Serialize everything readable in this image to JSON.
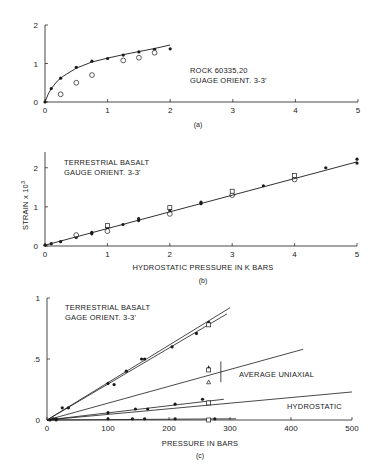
{
  "chart_data": [
    {
      "id": "a",
      "type": "scatter",
      "caption": "(a)",
      "title": "",
      "annotation": [
        "ROCK 60335,20",
        "GUAGE ORIENT. 3-3'"
      ],
      "xlabel": "",
      "ylabel": "",
      "xlim": [
        0,
        5
      ],
      "ylim": [
        0,
        2
      ],
      "x_ticks": [
        "0",
        "1",
        "2",
        "3",
        "4",
        "5"
      ],
      "y_ticks": [
        "0",
        "1",
        "2"
      ],
      "grid": false,
      "series": [
        {
          "name": "filled",
          "marker": "filled-circle",
          "x": [
            0,
            0.1,
            0.25,
            0.5,
            0.75,
            1.0,
            1.25,
            1.5,
            1.75,
            2.0
          ],
          "y": [
            0,
            0.35,
            0.62,
            0.9,
            1.06,
            1.13,
            1.22,
            1.3,
            1.37,
            1.38
          ]
        },
        {
          "name": "open",
          "marker": "open-circle",
          "x": [
            0.25,
            0.5,
            0.75,
            1.25,
            1.5,
            1.75
          ],
          "y": [
            0.2,
            0.5,
            0.7,
            1.08,
            1.15,
            1.28
          ]
        },
        {
          "name": "fit",
          "marker": "line",
          "x": [
            0,
            0.05,
            0.1,
            0.2,
            0.3,
            0.5,
            0.75,
            1.0,
            1.25,
            1.5,
            1.75,
            2.0
          ],
          "y": [
            0,
            0.2,
            0.35,
            0.55,
            0.68,
            0.88,
            1.04,
            1.14,
            1.23,
            1.31,
            1.39,
            1.48
          ]
        }
      ]
    },
    {
      "id": "b",
      "type": "scatter",
      "caption": "(b)",
      "annotation": [
        "TERRESTRIAL BASALT",
        "GAUGE ORIENT. 3-3'"
      ],
      "xlabel": "HYDROSTATIC PRESSURE IN K BARS",
      "ylabel": "STRAIN x 10³",
      "xlim": [
        0,
        5
      ],
      "ylim": [
        0,
        2.3
      ],
      "x_ticks": [
        "0",
        "1",
        "2",
        "3",
        "4",
        "5"
      ],
      "y_ticks": [
        "0",
        "1",
        "2"
      ],
      "grid": false,
      "series": [
        {
          "name": "filled",
          "marker": "filled-circle",
          "x": [
            0,
            0.1,
            0.25,
            0.5,
            0.5,
            0.75,
            0.75,
            1.0,
            1.0,
            1.25,
            1.5,
            1.5,
            2.0,
            2.5,
            2.5,
            3.0,
            3.5,
            4.0,
            4.5,
            5.0,
            5.0
          ],
          "y": [
            0.02,
            0.06,
            0.11,
            0.22,
            0.26,
            0.31,
            0.35,
            0.46,
            0.5,
            0.55,
            0.65,
            0.7,
            0.92,
            1.08,
            1.12,
            1.33,
            1.54,
            1.74,
            2.0,
            2.12,
            2.22
          ]
        },
        {
          "name": "open-circle",
          "marker": "open-circle",
          "x": [
            0.5,
            1.0,
            2.0,
            3.0,
            4.0
          ],
          "y": [
            0.28,
            0.38,
            0.82,
            1.3,
            1.7
          ]
        },
        {
          "name": "open-square",
          "marker": "open-square",
          "x": [
            1.0,
            2.0,
            3.0,
            4.0
          ],
          "y": [
            0.52,
            0.98,
            1.4,
            1.8
          ]
        },
        {
          "name": "fit",
          "marker": "line",
          "x": [
            0,
            5
          ],
          "y": [
            0.02,
            2.15
          ]
        }
      ]
    },
    {
      "id": "c",
      "type": "scatter",
      "caption": "(c)",
      "annotation": [
        "TERRESTRIAL BASALT",
        "GAGE ORIENT. 3-3'"
      ],
      "labels": [
        "AVERAGE UNIAXIAL",
        "HYDROSTATIC"
      ],
      "xlabel": "PRESSURE IN BARS",
      "ylabel": "",
      "xlim": [
        0,
        500
      ],
      "ylim": [
        0,
        1
      ],
      "x_ticks": [
        "0",
        "100",
        "200",
        "300",
        "400",
        "500"
      ],
      "y_ticks": [
        "0",
        ".5",
        "1"
      ],
      "grid": false,
      "lines": [
        {
          "name": "uniaxial-upper-1",
          "x": [
            0,
            300
          ],
          "y": [
            0,
            0.92
          ]
        },
        {
          "name": "uniaxial-upper-2",
          "x": [
            0,
            295
          ],
          "y": [
            0,
            0.87
          ]
        },
        {
          "name": "average-uniaxial",
          "x": [
            0,
            420
          ],
          "y": [
            0,
            0.58
          ]
        },
        {
          "name": "uniaxial-lower",
          "x": [
            0,
            290
          ],
          "y": [
            0,
            0.17
          ]
        },
        {
          "name": "hydrostatic",
          "x": [
            0,
            500
          ],
          "y": [
            0,
            0.23
          ]
        },
        {
          "name": "baseline",
          "x": [
            0,
            310
          ],
          "y": [
            0,
            0.01
          ]
        }
      ],
      "series": [
        {
          "name": "upper-filled",
          "marker": "filled-circle",
          "x": [
            10,
            25,
            35,
            100,
            110,
            130,
            155,
            160,
            205,
            245,
            265
          ],
          "y": [
            0.01,
            0.1,
            0.1,
            0.3,
            0.29,
            0.4,
            0.5,
            0.5,
            0.6,
            0.71,
            0.8
          ]
        },
        {
          "name": "upper-open-square",
          "marker": "open-square",
          "x": [
            265
          ],
          "y": [
            0.78
          ]
        },
        {
          "name": "mid-open",
          "marker": "open-triangle-square",
          "x": [
            265,
            265,
            265
          ],
          "y": [
            0.43,
            0.41,
            0.31
          ]
        },
        {
          "name": "lower-filled",
          "marker": "filled-circle",
          "x": [
            15,
            100,
            145,
            165,
            210,
            255
          ],
          "y": [
            0.01,
            0.06,
            0.09,
            0.09,
            0.13,
            0.17
          ]
        },
        {
          "name": "lower-open-square",
          "marker": "open-square",
          "x": [
            265
          ],
          "y": [
            0.14
          ]
        },
        {
          "name": "base-filled",
          "marker": "filled-circle",
          "x": [
            5,
            15,
            100,
            140,
            160,
            210,
            275
          ],
          "y": [
            0,
            0,
            0.01,
            0.01,
            0.01,
            0.01,
            0.01
          ]
        },
        {
          "name": "base-open-square",
          "marker": "open-square",
          "x": [
            265
          ],
          "y": [
            0.0
          ]
        }
      ],
      "error_bar": {
        "x": 285,
        "y_low": 0.31,
        "y_high": 0.48
      }
    }
  ],
  "text": {
    "a_caption": "(a)",
    "a_note_1": "ROCK 60335,20",
    "a_note_2": "GUAGE ORIENT. 3-3'",
    "b_caption": "(b)",
    "b_note_1": "TERRESTRIAL BASALT",
    "b_note_2": "GAUGE ORIENT. 3-3'",
    "b_xlabel": "HYDROSTATIC PRESSURE IN K BARS",
    "b_ylabel": "STRAIN x 10",
    "b_ylabel_sup": "3",
    "c_caption": "(c)",
    "c_note_1": "TERRESTRIAL BASALT",
    "c_note_2": "GAGE ORIENT. 3-3'",
    "c_label_uniaxial": "AVERAGE UNIAXIAL",
    "c_label_hydrostatic": "HYDROSTATIC",
    "c_xlabel": "PRESSURE IN BARS"
  },
  "colors": {
    "ink": "#1a1a1a",
    "background": "#ffffff"
  }
}
